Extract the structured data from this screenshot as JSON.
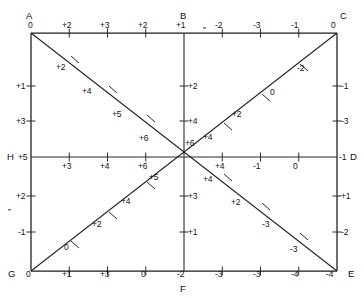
{
  "figure": {
    "nodes": [
      {
        "id": "A",
        "label": "A",
        "x": 30,
        "y": 15
      },
      {
        "id": "B",
        "label": "B",
        "x": 184,
        "y": 15
      },
      {
        "id": "C",
        "label": "C",
        "x": 338,
        "y": 15
      },
      {
        "id": "D",
        "label": "D",
        "x": 347,
        "y": 157
      },
      {
        "id": "E",
        "label": "E",
        "x": 345,
        "y": 274
      },
      {
        "id": "F",
        "label": "F",
        "x": 184,
        "y": 286
      },
      {
        "id": "G",
        "label": "G",
        "x": 13,
        "y": 274
      },
      {
        "id": "H",
        "label": "H",
        "x": 11,
        "y": 157
      }
    ],
    "corner_values": {
      "A": "0",
      "C": "0",
      "G": "0",
      "E": "-4",
      "H": "+5",
      "D": "-1",
      "B": "+1",
      "F": "-2"
    },
    "top_edge": {
      "name": "top-edge-A-to-C",
      "labels": [
        "0",
        "+2",
        "+3",
        "+2",
        "+1",
        "-2",
        "-3",
        "-1",
        "0"
      ]
    },
    "bottom_edge": {
      "name": "bottom-edge-G-to-E",
      "labels": [
        "0",
        "+1",
        "+3",
        "0",
        "-2",
        "-3",
        "-3",
        "-4",
        "-4"
      ]
    },
    "left_edge": {
      "name": "left-edge-A-to-G",
      "labels": [
        "0",
        "+1",
        "+3",
        "+5",
        "+2",
        "-1",
        "0"
      ]
    },
    "right_edge": {
      "name": "right-edge-C-to-E",
      "labels": [
        "0",
        "-1",
        "-3",
        "-1",
        "+1",
        "-2",
        "-4"
      ]
    },
    "middle_horizontal": {
      "name": "middle-row-H-to-D",
      "left_labels": [
        "+3",
        "+4",
        "+6"
      ],
      "right_labels": [
        "+4",
        "-1",
        "0"
      ]
    },
    "middle_vertical": {
      "name": "middle-column-B-to-F",
      "upper_labels": [
        "+2",
        "+4",
        "+6"
      ],
      "lower_labels": [
        "+3",
        "+1"
      ]
    },
    "diagonal_A_E": {
      "name": "diagonal-A-to-E",
      "labels": [
        "+2",
        "+4",
        "+5",
        "+6",
        "+4",
        "+2",
        "-3",
        "-3"
      ]
    },
    "diagonal_G_C": {
      "name": "diagonal-G-to-C",
      "labels": [
        "0",
        "+2",
        "+4",
        "+5",
        "+4",
        "+2",
        "0",
        "-2"
      ]
    },
    "colors": {
      "line": "#1b1b1b",
      "text": "#141414",
      "background": "#ffffff"
    }
  }
}
